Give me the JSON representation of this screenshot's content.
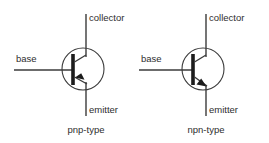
{
  "figure": {
    "background_color": "#ffffff",
    "line_color": "#3b3b3b",
    "bar_color": "#1c1c1c",
    "text_color": "#2e2e2e"
  },
  "symbols": [
    {
      "id": "pnp",
      "caption": "pnp-type",
      "arrow_direction": "inward",
      "terminals": {
        "collector": "collector",
        "base": "base",
        "emitter": "emitter"
      }
    },
    {
      "id": "npn",
      "caption": "npn-type",
      "arrow_direction": "outward",
      "terminals": {
        "collector": "collector",
        "base": "base",
        "emitter": "emitter"
      }
    }
  ]
}
